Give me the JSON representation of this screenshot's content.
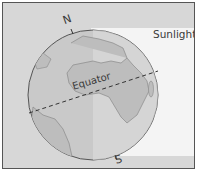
{
  "diagram": {
    "labels": {
      "north": "N",
      "south": "S",
      "equator": "Equator",
      "sunlight": "Sunlight"
    },
    "colors": {
      "globe_fill": "#c9c9c9",
      "land_fill": "#bdbdbd",
      "sunlit_band": "#f4f4f4",
      "background": "#d7d7d7",
      "outline": "#555555"
    }
  }
}
